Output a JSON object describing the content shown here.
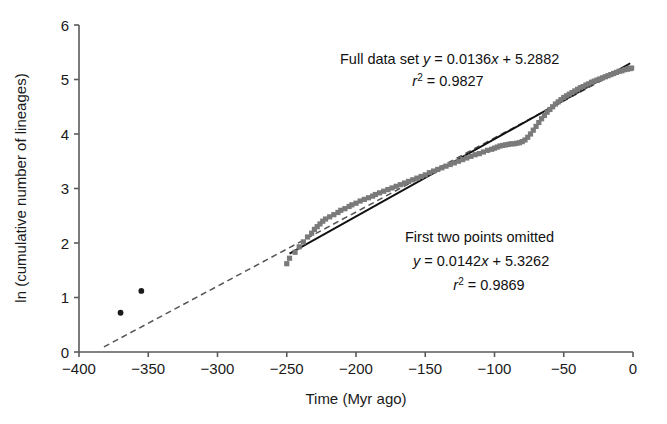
{
  "chart_data": {
    "type": "scatter",
    "title": "",
    "xlabel": "Time (Myr ago)",
    "ylabel": "ln (cumulative number of lineages)",
    "xlim": [
      -400,
      0
    ],
    "ylim": [
      0,
      6
    ],
    "xticks": [
      -400,
      -350,
      -300,
      -250,
      -200,
      -150,
      -100,
      -50,
      0
    ],
    "xtick_labels": [
      "−400",
      "−350",
      "−300",
      "−250",
      "−200",
      "−150",
      "−100",
      "−50",
      "0"
    ],
    "yticks": [
      0,
      1,
      2,
      3,
      4,
      5,
      6
    ],
    "ytick_labels": [
      "0",
      "1",
      "2",
      "3",
      "4",
      "5",
      "6"
    ],
    "grid": false,
    "legend": "none",
    "series": [
      {
        "name": "first two points",
        "marker": "circle",
        "color": "#1a1a1a",
        "points": [
          [
            -370,
            0.72
          ],
          [
            -355,
            1.12
          ]
        ]
      },
      {
        "name": "lineage accumulation",
        "marker": "square",
        "color": "#7a7a7a",
        "points": [
          [
            -250,
            1.62
          ],
          [
            -248,
            1.72
          ],
          [
            -244,
            1.83
          ],
          [
            -241,
            1.93
          ],
          [
            -238,
            2.02
          ],
          [
            -235,
            2.11
          ],
          [
            -232,
            2.18
          ],
          [
            -230,
            2.25
          ],
          [
            -228,
            2.3
          ],
          [
            -226,
            2.35
          ],
          [
            -224,
            2.4
          ],
          [
            -222,
            2.44
          ],
          [
            -219,
            2.48
          ],
          [
            -216,
            2.52
          ],
          [
            -213,
            2.56
          ],
          [
            -211,
            2.6
          ],
          [
            -208,
            2.63
          ],
          [
            -205,
            2.67
          ],
          [
            -203,
            2.7
          ],
          [
            -200,
            2.73
          ],
          [
            -197,
            2.77
          ],
          [
            -194,
            2.8
          ],
          [
            -191,
            2.83
          ],
          [
            -188,
            2.86
          ],
          [
            -186,
            2.89
          ],
          [
            -183,
            2.92
          ],
          [
            -180,
            2.95
          ],
          [
            -177,
            2.98
          ],
          [
            -174,
            3.01
          ],
          [
            -171,
            3.04
          ],
          [
            -168,
            3.07
          ],
          [
            -165,
            3.1
          ],
          [
            -162,
            3.13
          ],
          [
            -159,
            3.16
          ],
          [
            -156,
            3.19
          ],
          [
            -153,
            3.22
          ],
          [
            -150,
            3.25
          ],
          [
            -147,
            3.29
          ],
          [
            -144,
            3.32
          ],
          [
            -141,
            3.35
          ],
          [
            -138,
            3.38
          ],
          [
            -135,
            3.41
          ],
          [
            -132,
            3.44
          ],
          [
            -129,
            3.47
          ],
          [
            -126,
            3.5
          ],
          [
            -123,
            3.53
          ],
          [
            -120,
            3.56
          ],
          [
            -117,
            3.59
          ],
          [
            -114,
            3.62
          ],
          [
            -111,
            3.64
          ],
          [
            -108,
            3.67
          ],
          [
            -105,
            3.7
          ],
          [
            -102,
            3.72
          ],
          [
            -100,
            3.74
          ],
          [
            -98,
            3.76
          ],
          [
            -96,
            3.78
          ],
          [
            -94,
            3.79
          ],
          [
            -92,
            3.8
          ],
          [
            -90,
            3.81
          ],
          [
            -88,
            3.82
          ],
          [
            -86,
            3.82
          ],
          [
            -84,
            3.83
          ],
          [
            -82,
            3.84
          ],
          [
            -80,
            3.86
          ],
          [
            -78,
            3.89
          ],
          [
            -76,
            3.94
          ],
          [
            -74,
            4.0
          ],
          [
            -72,
            4.07
          ],
          [
            -70,
            4.14
          ],
          [
            -68,
            4.21
          ],
          [
            -66,
            4.28
          ],
          [
            -64,
            4.34
          ],
          [
            -62,
            4.4
          ],
          [
            -60,
            4.45
          ],
          [
            -58,
            4.5
          ],
          [
            -56,
            4.55
          ],
          [
            -54,
            4.59
          ],
          [
            -52,
            4.63
          ],
          [
            -50,
            4.67
          ],
          [
            -48,
            4.7
          ],
          [
            -46,
            4.73
          ],
          [
            -44,
            4.76
          ],
          [
            -42,
            4.79
          ],
          [
            -40,
            4.82
          ],
          [
            -38,
            4.85
          ],
          [
            -36,
            4.87
          ],
          [
            -34,
            4.9
          ],
          [
            -32,
            4.92
          ],
          [
            -30,
            4.95
          ],
          [
            -28,
            4.97
          ],
          [
            -26,
            4.99
          ],
          [
            -24,
            5.01
          ],
          [
            -22,
            5.03
          ],
          [
            -20,
            5.05
          ],
          [
            -18,
            5.07
          ],
          [
            -16,
            5.09
          ],
          [
            -14,
            5.11
          ],
          [
            -12,
            5.13
          ],
          [
            -10,
            5.15
          ],
          [
            -8,
            5.16
          ],
          [
            -6,
            5.18
          ],
          [
            -4,
            5.19
          ],
          [
            -2,
            5.2
          ],
          [
            -1,
            5.21
          ]
        ]
      }
    ],
    "fits": [
      {
        "name": "Full data set",
        "style": "dashed",
        "color": "#555555",
        "slope": 0.0136,
        "intercept": 5.2882,
        "r_squared": 0.9827,
        "x_start": -382,
        "x_end": -3
      },
      {
        "name": "First two points omitted",
        "style": "solid",
        "color": "#111111",
        "slope": 0.0142,
        "intercept": 5.3262,
        "r_squared": 0.9869,
        "x_start": -248,
        "x_end": -2
      }
    ],
    "annotations": [
      {
        "id": "full-data-set",
        "line1_prefix": "Full data set ",
        "line1_var": "y",
        "line1_eq": " = 0.0136",
        "line1_xvar": "x",
        "line1_rest": " + 5.2882",
        "line2_var": "r",
        "line2_sup": "2",
        "line2_rest": " = 0.9827"
      },
      {
        "id": "first-two-omitted",
        "line1": "First two points omitted",
        "line2_var": "y",
        "line2_eq": " = 0.0142",
        "line2_xvar": "x",
        "line2_rest": " + 5.3262",
        "line3_var": "r",
        "line3_sup": "2",
        "line3_rest": " = 0.9869"
      }
    ]
  }
}
